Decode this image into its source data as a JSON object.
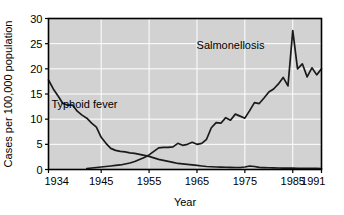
{
  "chart_data": {
    "type": "line",
    "title": "",
    "xlabel": "Year",
    "ylabel": "Cases per 100,000 population",
    "xlim": [
      1934,
      1991
    ],
    "ylim": [
      0,
      30
    ],
    "xticks": [
      1934,
      1945,
      1955,
      1965,
      1975,
      1985,
      1991
    ],
    "xtick_labels": [
      "1934",
      "1945",
      "1955",
      "1965",
      "1975",
      "1985",
      "1991"
    ],
    "yticks": [
      0,
      5,
      10,
      15,
      20,
      25,
      30
    ],
    "ytick_labels": [
      "0",
      "5",
      "10",
      "15",
      "20",
      "25",
      "30"
    ],
    "grid": "white horizontal and vertical gridlines on gray panel",
    "legend_position": "inline annotations on plot",
    "plot_bgcolor": "#d2d2d2",
    "gridline_color": "#ffffff",
    "line_color": "#1a1a1a",
    "frame_color": "#000000",
    "series": [
      {
        "name": "Typhoid fever",
        "annotation": "Typhoid fever",
        "annotation_x": 1941.5,
        "annotation_y": 12.2,
        "x": [
          1934,
          1935,
          1936,
          1937,
          1938,
          1939,
          1940,
          1941,
          1942,
          1943,
          1944,
          1945,
          1946,
          1947,
          1948,
          1949,
          1950,
          1951,
          1952,
          1953,
          1954,
          1955,
          1956,
          1957,
          1958,
          1959,
          1960,
          1961,
          1962,
          1963,
          1964,
          1965,
          1966,
          1967,
          1968,
          1969,
          1970,
          1971,
          1972,
          1973,
          1974,
          1975,
          1976,
          1977,
          1978,
          1979,
          1980,
          1981,
          1982,
          1983,
          1984,
          1985,
          1986,
          1987,
          1988,
          1989,
          1990,
          1991
        ],
        "y": [
          17.8,
          16.0,
          14.6,
          13.1,
          12.8,
          12.8,
          11.6,
          10.8,
          10.2,
          9.2,
          8.4,
          6.4,
          5.2,
          4.2,
          3.8,
          3.6,
          3.5,
          3.3,
          3.2,
          3.0,
          2.8,
          2.6,
          2.3,
          2.0,
          1.8,
          1.6,
          1.4,
          1.2,
          1.1,
          1.0,
          0.9,
          0.8,
          0.7,
          0.6,
          0.55,
          0.5,
          0.48,
          0.45,
          0.42,
          0.4,
          0.4,
          0.5,
          0.7,
          0.6,
          0.42,
          0.38,
          0.35,
          0.33,
          0.3,
          0.28,
          0.27,
          0.26,
          0.25,
          0.25,
          0.24,
          0.23,
          0.22,
          0.2
        ]
      },
      {
        "name": "Salmonellosis",
        "annotation": "Salmonellosis",
        "annotation_x": 1972.0,
        "annotation_y": 24.0,
        "x": [
          1942,
          1943,
          1944,
          1945,
          1946,
          1947,
          1948,
          1949,
          1950,
          1951,
          1952,
          1953,
          1954,
          1955,
          1956,
          1957,
          1958,
          1959,
          1960,
          1961,
          1962,
          1963,
          1964,
          1965,
          1966,
          1967,
          1968,
          1969,
          1970,
          1971,
          1972,
          1973,
          1974,
          1975,
          1976,
          1977,
          1978,
          1979,
          1980,
          1981,
          1982,
          1983,
          1984,
          1985,
          1986,
          1987,
          1988,
          1989,
          1990,
          1991
        ],
        "y": [
          0.2,
          0.3,
          0.4,
          0.5,
          0.6,
          0.7,
          0.8,
          0.9,
          1.1,
          1.3,
          1.6,
          2.0,
          2.4,
          2.9,
          3.6,
          4.3,
          4.4,
          4.4,
          4.5,
          5.2,
          4.8,
          5.0,
          5.4,
          5.0,
          5.2,
          6.0,
          8.3,
          9.3,
          9.2,
          10.3,
          9.8,
          11.0,
          10.6,
          10.2,
          11.7,
          13.3,
          13.1,
          14.2,
          15.4,
          16.0,
          17.0,
          18.3,
          16.6,
          27.6,
          20.0,
          21.0,
          18.4,
          20.2,
          18.8,
          20.0
        ]
      }
    ]
  },
  "figure": {
    "x_axis_title": "Year",
    "y_axis_title": "Cases per 100,000 population"
  }
}
